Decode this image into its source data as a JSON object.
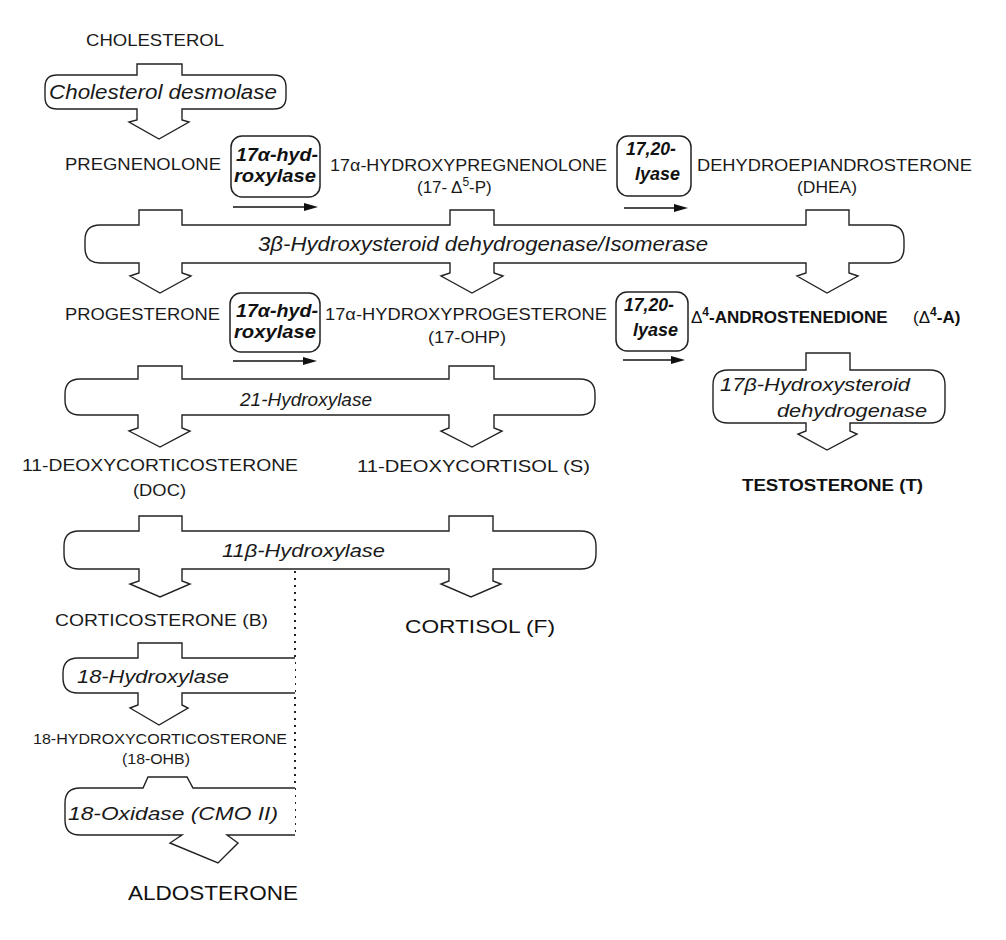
{
  "diagram": {
    "metabolites": {
      "cholesterol": "CHOLESTEROL",
      "pregnenolone": "PREGNENOLONE",
      "hydroxypregnenolone": {
        "name": "17α-HYDROXYPREGNENOLONE",
        "abbr_prefix": "(17- Δ",
        "abbr_sup": "5",
        "abbr_suffix": "-P)"
      },
      "dhea": {
        "name": "DEHYDROEPIANDROSTERONE",
        "abbr": "(DHEA)"
      },
      "progesterone": "PROGESTERONE",
      "hydroxyprogesterone": {
        "name": "17α-HYDROXYPROGESTERONE",
        "abbr": "(17-OHP)"
      },
      "androstenedione": {
        "prefix": "Δ",
        "sup": "4",
        "name": "-ANDROSTENEDIONE",
        "abbr_prefix": "(Δ",
        "abbr_sup": "4",
        "abbr_suffix": "-A)"
      },
      "testosterone": "TESTOSTERONE  (T)",
      "deoxycorticosterone": {
        "name": "11-DEOXYCORTICOSTERONE",
        "abbr": "(DOC)"
      },
      "deoxycortisol": "11-DEOXYCORTISOL  (S)",
      "corticosterone": "CORTICOSTERONE  (B)",
      "cortisol": "CORTISOL  (F)",
      "hydroxycorticosterone": {
        "name": "18-HYDROXYCORTICOSTERONE",
        "abbr": "(18-OHB)"
      },
      "aldosterone": "ALDOSTERONE"
    },
    "enzymes": {
      "desmolase": "Cholesterol desmolase",
      "hydroxylase_17a_top": {
        "line1": "17α-hyd-",
        "line2": "roxylase"
      },
      "lyase_top": {
        "line1": "17,20-",
        "line2": "lyase"
      },
      "hsd_3b": "3β-Hydroxysteroid dehydrogenase/Isomerase",
      "hydroxylase_17a_bottom": {
        "line1": "17α-hyd-",
        "line2": "roxylase"
      },
      "lyase_bottom": {
        "line1": "17,20-",
        "line2": "lyase"
      },
      "hsd_17b": {
        "line1": "17β-Hydroxysteroid",
        "line2": "dehydrogenase"
      },
      "hydroxylase_21": "21-Hydroxylase",
      "hydroxylase_11b": "11β-Hydroxylase",
      "hydroxylase_18": "18-Hydroxylase",
      "oxidase_18": "18-Oxidase  (CMO II)"
    },
    "colors": {
      "ink": "#1a1a1a",
      "background": "#ffffff"
    }
  }
}
